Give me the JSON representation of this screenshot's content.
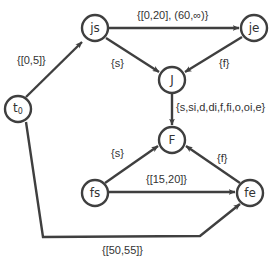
{
  "diagram": {
    "type": "directed-graph",
    "colors": {
      "stroke": "#3f3f3f",
      "text": "#333333",
      "background": "#ffffff"
    },
    "nodes": {
      "t0": {
        "label": "t",
        "subscript": "0"
      },
      "js": {
        "label": "js"
      },
      "je": {
        "label": "je"
      },
      "J": {
        "label": "J"
      },
      "F": {
        "label": "F"
      },
      "fs": {
        "label": "fs"
      },
      "fe": {
        "label": "fe"
      }
    },
    "edges": {
      "t0_js": {
        "from": "t0",
        "to": "js",
        "label": "{[0,5]}"
      },
      "js_je": {
        "from": "js",
        "to": "je",
        "label": "{[0,20], (60,∞)}"
      },
      "js_J": {
        "from": "js",
        "to": "J",
        "label": "{s}"
      },
      "je_J": {
        "from": "je",
        "to": "J",
        "label": "{f}"
      },
      "J_F": {
        "from": "J",
        "to": "F",
        "label": "{s,si,d,di,f,fi,o,oi,e}"
      },
      "fs_F": {
        "from": "fs",
        "to": "F",
        "label": "{s}"
      },
      "fe_F": {
        "from": "fe",
        "to": "F",
        "label": "{f}"
      },
      "fs_fe": {
        "from": "fs",
        "to": "fe",
        "label": "{[15,20]}"
      },
      "t0_fe": {
        "from": "t0",
        "to": "fe",
        "label": "{[50,55]}"
      }
    }
  }
}
